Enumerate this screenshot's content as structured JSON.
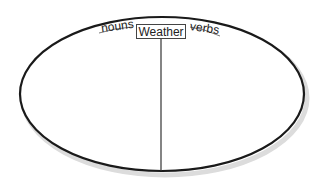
{
  "diagram": {
    "type": "split-oval-organizer",
    "title": "Weather",
    "left_label": "nouns",
    "right_label": "verbs",
    "colors": {
      "stroke": "#1a1a1a",
      "shadow": "#d8d8d8",
      "background": "#ffffff"
    }
  }
}
